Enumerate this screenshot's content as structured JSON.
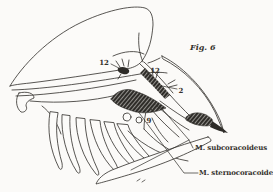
{
  "figure": {
    "caption": "Fig. 6",
    "annotations": {
      "n12_left": "12",
      "n12_right": "12",
      "n2": "2",
      "n9": "9"
    },
    "muscle_labels": {
      "subcoracoideus": "M. subcoracoideus",
      "sternocoracoideus": "M. sternocoracoideus"
    }
  },
  "colors": {
    "background": "#fbfaf8",
    "ink": "#2e2c28"
  }
}
